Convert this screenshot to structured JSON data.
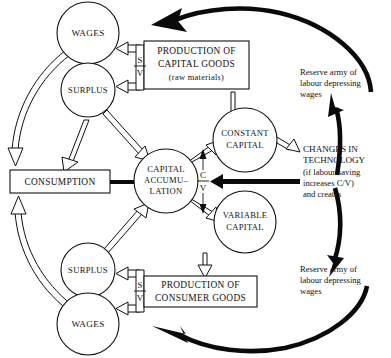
{
  "diagram": {
    "nodes": {
      "wages_top": {
        "label": "WAGES",
        "shape": "circle"
      },
      "surplus_top": {
        "label": "SURPLUS",
        "shape": "circle"
      },
      "consumption": {
        "label": "CONSUMPTION",
        "shape": "rect"
      },
      "capital_accumulation": {
        "line1": "CAPITAL",
        "line2": "ACCUMU–",
        "line3": "LATION",
        "shape": "circle"
      },
      "constant_capital": {
        "line1": "CONSTANT",
        "line2": "CAPITAL",
        "shape": "circle"
      },
      "variable_capital": {
        "line1": "VARIABLE",
        "line2": "CAPITAL",
        "shape": "circle"
      },
      "surplus_bottom": {
        "label": "SURPLUS",
        "shape": "circle"
      },
      "wages_bottom": {
        "label": "WAGES",
        "shape": "circle"
      },
      "production_capital_goods": {
        "line1": "PRODUCTION OF",
        "line2": "CAPITAL GOODS",
        "line3": "(raw materials)",
        "shape": "rect"
      },
      "production_consumer_goods": {
        "line1": "PRODUCTION OF",
        "line2": "CONSUMER GOODS",
        "shape": "rect"
      }
    },
    "fractions": {
      "sv_top": {
        "numerator": "S",
        "denominator": "V"
      },
      "sv_bottom": {
        "numerator": "S",
        "denominator": "V"
      },
      "cv_center": {
        "numerator": "C",
        "denominator": "V"
      }
    },
    "annotations": {
      "technology": {
        "line1": "CHANGES IN",
        "line2": "TECHNOLOGY",
        "line3": "(if labour-saving",
        "line4": "increases C/V)",
        "line5": "and creates"
      },
      "reserve_army_top": {
        "line1": "Reserve army of",
        "line2": "labour depressing",
        "line3": "wages"
      },
      "reserve_army_bottom": {
        "line1": "Reserve army of",
        "line2": "labour depressing",
        "line3": "wages"
      }
    },
    "colors": {
      "ink": "#111111",
      "paper": "#ffffff",
      "heavy": "#0a0a0a"
    }
  }
}
